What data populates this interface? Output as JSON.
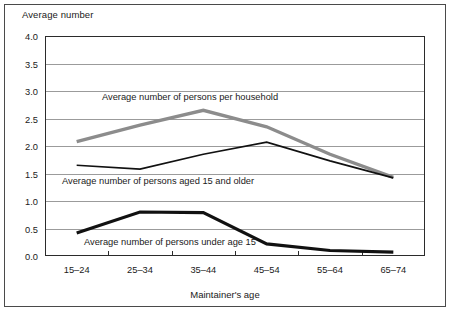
{
  "figure": {
    "y_axis_caption": "Average number",
    "x_axis_caption": "Maintainer's age"
  },
  "chart_data": {
    "type": "line",
    "title": "",
    "xlabel": "Maintainer's age",
    "ylabel": "Average number",
    "categories": [
      "15–24",
      "25–34",
      "35–44",
      "45–54",
      "55–64",
      "65–74"
    ],
    "ylim": [
      0.0,
      4.0
    ],
    "ytick_labels": [
      "0.0",
      "0.5",
      "1.0",
      "1.5",
      "2.0",
      "2.5",
      "3.0",
      "3.5",
      "4.0"
    ],
    "ytick_values": [
      0.0,
      0.5,
      1.0,
      1.5,
      2.0,
      2.5,
      3.0,
      3.5,
      4.0
    ],
    "grid": true,
    "legend_position": "inline-annotations",
    "series": [
      {
        "name": "Average number of persons per household",
        "color": "#8c8c8c",
        "width": 3.4,
        "values": [
          2.08,
          2.38,
          2.65,
          2.35,
          1.85,
          1.43
        ]
      },
      {
        "name": "Average number of persons aged 15 and older",
        "color": "#111111",
        "width": 1.7,
        "values": [
          1.65,
          1.58,
          1.85,
          2.07,
          1.73,
          1.42
        ]
      },
      {
        "name": "Average number of persons under age 15",
        "color": "#111111",
        "width": 3.2,
        "values": [
          0.42,
          0.8,
          0.79,
          0.22,
          0.1,
          0.07
        ]
      }
    ],
    "annotations": [
      {
        "text": "Average number of persons per household",
        "x": 102,
        "y": 100
      },
      {
        "text": "Average number of persons aged 15 and older",
        "x": 62,
        "y": 184
      },
      {
        "text": "Average number of persons under age 15",
        "x": 84,
        "y": 245
      }
    ]
  }
}
